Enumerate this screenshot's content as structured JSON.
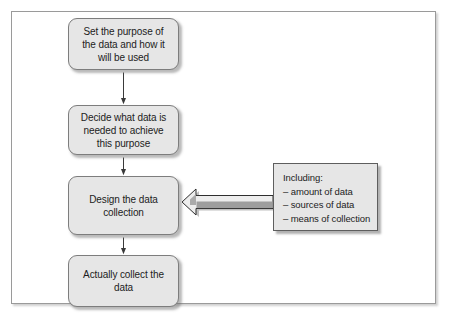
{
  "figure": {
    "type": "flowchart",
    "orientation": "vertical",
    "frame_color": "#9a9a9a",
    "node_fill": "#e6e6e6",
    "node_border": "#7d7d7d",
    "text_color": "#1c1c1c"
  },
  "nodes": [
    {
      "id": "purpose",
      "shape": "rounded-rectangle",
      "lines": [
        "Set the purpose of",
        "the data and how it",
        "will be used"
      ],
      "text": "Set the purpose of the data and how it will be used"
    },
    {
      "id": "decide",
      "shape": "rounded-rectangle",
      "lines": [
        "Decide what data is",
        "needed to achieve",
        "this purpose"
      ],
      "text": "Decide what data is needed to achieve this purpose"
    },
    {
      "id": "design",
      "shape": "rounded-rectangle",
      "lines": [
        "Design the data",
        "collection"
      ],
      "text": "Design the data collection"
    },
    {
      "id": "collect",
      "shape": "rounded-rectangle",
      "lines": [
        "Actually collect the",
        "data"
      ],
      "text": "Actually collect the data"
    }
  ],
  "note": {
    "id": "including",
    "shape": "rectangle",
    "heading": "Including:",
    "items": [
      "– amount of data",
      "– sources of data",
      "– means of collection"
    ]
  },
  "connectors": [
    {
      "id": "purpose-to-decide",
      "from": "purpose",
      "to": "decide",
      "style": "thin-line-arrow",
      "direction": "down"
    },
    {
      "id": "decide-to-design",
      "from": "decide",
      "to": "design",
      "style": "thin-line-arrow",
      "direction": "down"
    },
    {
      "id": "design-to-collect",
      "from": "design",
      "to": "collect",
      "style": "thin-line-arrow",
      "direction": "down"
    },
    {
      "id": "including-to-design",
      "from": "including",
      "to": "design",
      "style": "block-arrow",
      "direction": "left"
    }
  ]
}
